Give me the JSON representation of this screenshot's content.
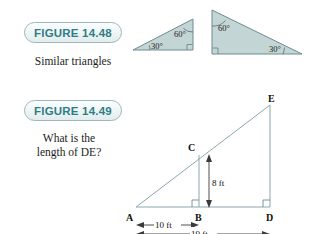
{
  "page": {
    "background_color": "#ffffff",
    "figure_fill_color": "#c4d5d5",
    "figure_stroke_color": "#6e8b90",
    "badge_text_color": "#2e7d86"
  },
  "figure_1": {
    "badge_label": "FIGURE 14.48",
    "caption": "Similar triangles",
    "small_triangle": {
      "name": "small-similar-triangle",
      "angles": [
        {
          "label": "30°",
          "vertex": "bottom-left"
        },
        {
          "label": "60°",
          "vertex": "top-right"
        },
        {
          "label": "right-angle",
          "vertex": "bottom-right"
        }
      ]
    },
    "large_triangle": {
      "name": "large-similar-triangle",
      "angles": [
        {
          "label": "60°",
          "vertex": "top-left"
        },
        {
          "label": "30°",
          "vertex": "bottom-right"
        },
        {
          "label": "right-angle",
          "vertex": "bottom-left"
        }
      ]
    }
  },
  "figure_2": {
    "badge_label": "FIGURE 14.49",
    "caption": "What is the\nlength of DE?",
    "diagram": {
      "name": "nested-right-triangles",
      "vertices": [
        "A",
        "B",
        "C",
        "D",
        "E"
      ],
      "vertex_labels": {
        "A": "A",
        "B": "B",
        "C": "C",
        "D": "D",
        "E": "E"
      },
      "dimensions": [
        {
          "label": "8 ft",
          "from": "B",
          "to": "C",
          "orientation": "vertical"
        },
        {
          "label": "10 ft",
          "from": "A",
          "to": "B",
          "orientation": "horizontal"
        },
        {
          "label": "19 ft",
          "from": "A",
          "to": "D",
          "orientation": "horizontal"
        }
      ],
      "right_angles": [
        "B",
        "D"
      ]
    }
  },
  "chart_data": {
    "type": "diagram",
    "figures": [
      {
        "id": "14.48",
        "caption": "Similar triangles",
        "shapes": [
          {
            "type": "right-triangle",
            "size": "small",
            "angles": [
              30,
              60,
              90
            ]
          },
          {
            "type": "right-triangle",
            "size": "large",
            "angles": [
              60,
              30,
              90
            ]
          }
        ]
      },
      {
        "id": "14.49",
        "caption": "What is the length of DE?",
        "measurements": [
          {
            "segment": "BC",
            "value": 8,
            "unit": "ft"
          },
          {
            "segment": "AB",
            "value": 10,
            "unit": "ft"
          },
          {
            "segment": "AD",
            "value": 19,
            "unit": "ft"
          }
        ],
        "unknown": "DE"
      }
    ]
  }
}
